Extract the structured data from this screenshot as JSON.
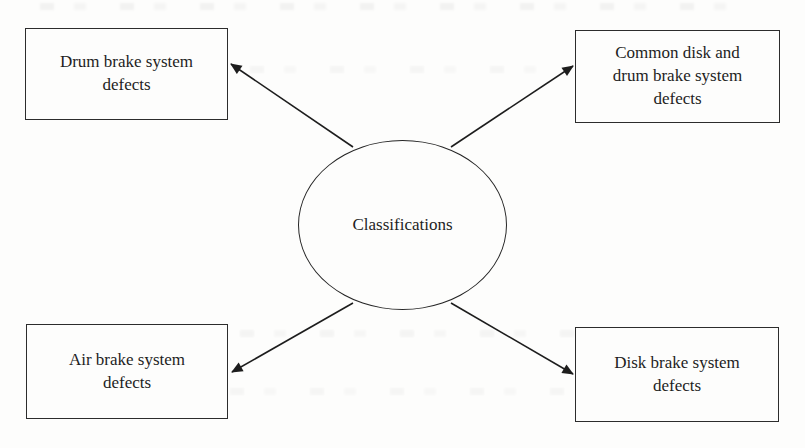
{
  "figure": {
    "type": "radial-classification-diagram",
    "colors": {
      "background": "#fdfdfc",
      "line": "#1d1d1d",
      "box_border": "#2c2c2c",
      "text": "#1e1e1e"
    },
    "center": {
      "label": "Classifications"
    },
    "nodes": [
      {
        "position": "top-left",
        "label": "Drum brake system defects",
        "lines": [
          "Drum brake system",
          "defects"
        ]
      },
      {
        "position": "top-right",
        "label": "Common disk and drum brake system defects",
        "lines": [
          "Common disk and",
          "drum brake system",
          "defects"
        ]
      },
      {
        "position": "bottom-left",
        "label": "Air brake system defects",
        "lines": [
          "Air brake system",
          "defects"
        ]
      },
      {
        "position": "bottom-right",
        "label": "Disk brake system defects",
        "lines": [
          "Disk brake system",
          "defects"
        ]
      }
    ],
    "arrows": [
      {
        "from": "center",
        "to": "top-left"
      },
      {
        "from": "center",
        "to": "top-right"
      },
      {
        "from": "center",
        "to": "bottom-left"
      },
      {
        "from": "center",
        "to": "bottom-right"
      }
    ]
  }
}
